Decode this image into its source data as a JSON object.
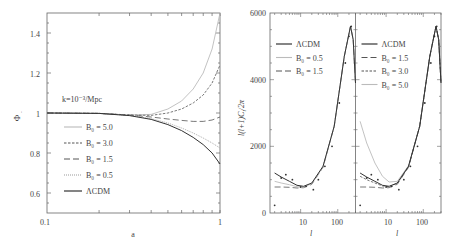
{
  "chart_data": [
    {
      "type": "line",
      "panel": "left",
      "title": "",
      "annotation": "k=10⁻³/Mpc",
      "xlabel": "a",
      "ylabel": "Φ₋",
      "xscale": "log",
      "xlim": [
        0.1,
        1
      ],
      "ylim": [
        0.5,
        1.5
      ],
      "xticks": [
        "0.1",
        "1"
      ],
      "yticks": [
        "0.6",
        "0.8",
        "1",
        "1.2",
        "1.4"
      ],
      "grid": false,
      "legend_position": "left-middle",
      "x": [
        0.1,
        0.2,
        0.3,
        0.4,
        0.5,
        0.6,
        0.7,
        0.8,
        0.9,
        1.0
      ],
      "series": [
        {
          "name": "B₀ = 5.0",
          "style": "dotted-light",
          "values": [
            1.0,
            0.998,
            0.99,
            0.993,
            1.02,
            1.06,
            1.12,
            1.2,
            1.32,
            1.5
          ]
        },
        {
          "name": "B₀ = 3.0",
          "style": "dashed-short",
          "values": [
            1.0,
            0.998,
            0.99,
            0.988,
            1.0,
            1.02,
            1.05,
            1.09,
            1.15,
            1.24
          ]
        },
        {
          "name": "B₀ = 1.5",
          "style": "dashed-long",
          "values": [
            1.0,
            0.998,
            0.99,
            0.98,
            0.97,
            0.963,
            0.958,
            0.958,
            0.965,
            0.98
          ]
        },
        {
          "name": "B₀ = 0.5",
          "style": "dotted-gray",
          "values": [
            1.0,
            0.998,
            0.988,
            0.972,
            0.95,
            0.925,
            0.9,
            0.875,
            0.85,
            0.825
          ]
        },
        {
          "name": "ΛCDM",
          "style": "solid",
          "values": [
            1.0,
            0.998,
            0.987,
            0.968,
            0.942,
            0.912,
            0.878,
            0.842,
            0.8,
            0.745
          ]
        }
      ]
    },
    {
      "type": "line",
      "panel": "right-a",
      "title": "",
      "xlabel": "l",
      "ylabel": "l(l+1)C_l/2π",
      "xscale": "log",
      "xlim": [
        1.5,
        300
      ],
      "ylim": [
        0,
        6000
      ],
      "xticks": [
        "10",
        "100"
      ],
      "yticks": [
        "0",
        "2000",
        "4000",
        "6000"
      ],
      "grid": false,
      "legend_position": "upper-left",
      "x": [
        2,
        3,
        5,
        8,
        12,
        20,
        40,
        80,
        150,
        220,
        260,
        300
      ],
      "series": [
        {
          "name": "ΛCDM",
          "style": "solid",
          "values": [
            1200,
            1080,
            950,
            830,
            800,
            900,
            1400,
            2600,
            4700,
            5600,
            5200,
            3900
          ]
        },
        {
          "name": "B₀ = 0.5",
          "style": "dotted-light",
          "values": [
            950,
            900,
            850,
            790,
            780,
            880,
            1380,
            2600,
            4700,
            5600,
            5200,
            3900
          ]
        },
        {
          "name": "B₀ = 1.5",
          "style": "dashed-long",
          "values": [
            780,
            780,
            770,
            750,
            760,
            860,
            1370,
            2600,
            4700,
            5600,
            5200,
            3900
          ]
        }
      ],
      "data_points": {
        "x": [
          2,
          3,
          4,
          6,
          10,
          14,
          22,
          30,
          45,
          70,
          110,
          160,
          200,
          230
        ],
        "y": [
          230,
          1050,
          1150,
          1000,
          780,
          800,
          700,
          1000,
          1400,
          2000,
          3300,
          4500,
          5300,
          5600
        ]
      }
    },
    {
      "type": "line",
      "panel": "right-b",
      "title": "",
      "xlabel": "l",
      "ylabel": "",
      "xscale": "log",
      "xlim": [
        1.5,
        300
      ],
      "ylim": [
        0,
        6000
      ],
      "xticks": [
        "10",
        "100"
      ],
      "grid": false,
      "legend_position": "upper-left",
      "x": [
        2,
        3,
        5,
        8,
        12,
        20,
        40,
        80,
        150,
        220,
        260,
        300
      ],
      "series": [
        {
          "name": "ΛCDM",
          "style": "solid",
          "values": [
            1200,
            1080,
            950,
            830,
            800,
            900,
            1400,
            2600,
            4700,
            5600,
            5200,
            3900
          ]
        },
        {
          "name": "B₀ = 1.5",
          "style": "dashed-long",
          "values": [
            780,
            780,
            770,
            750,
            760,
            860,
            1370,
            2600,
            4700,
            5600,
            5200,
            3900
          ]
        },
        {
          "name": "B₀ = 3.0",
          "style": "dashed-short",
          "values": [
            1100,
            1000,
            900,
            810,
            790,
            890,
            1390,
            2600,
            4700,
            5600,
            5200,
            3900
          ]
        },
        {
          "name": "B₀ = 5.0",
          "style": "dotted-light",
          "values": [
            2750,
            2100,
            1500,
            1100,
            930,
            950,
            1420,
            2600,
            4700,
            5600,
            5200,
            3900
          ]
        }
      ],
      "data_points": {
        "x": [
          2,
          3,
          4,
          6,
          10,
          14,
          22,
          30,
          45,
          70,
          110,
          160,
          200,
          230
        ],
        "y": [
          230,
          1050,
          1150,
          1000,
          780,
          800,
          700,
          1000,
          1400,
          2000,
          3300,
          4500,
          5300,
          5600
        ]
      }
    }
  ],
  "labels": {
    "left_annotation": "k=10⁻³/Mpc",
    "left_xlabel": "a",
    "left_ylabel": "Φ",
    "left_ylabel_sub": "-",
    "left_xtick_0": "0.1",
    "left_xtick_1": "1",
    "left_yticks": [
      "1.4",
      "1.2",
      "1",
      "0.8",
      "0.6"
    ],
    "left_legend": [
      "B₀ = 5.0",
      "B₀ = 3.0",
      "B₀ = 1.5",
      "B₀ = 0.5",
      "ΛCDM"
    ],
    "right_ylabel": "l(l+1)C",
    "right_ylabel_sub": "l",
    "right_ylabel_tail": "/2π",
    "right_yticks": [
      "6000",
      "4000",
      "2000",
      "0"
    ],
    "right_xticks": [
      "10",
      "100"
    ],
    "right_xlabel": "l",
    "right_a_legend": [
      "ΛCDM",
      "B₀ = 0.5",
      "B₀ = 1.5"
    ],
    "right_b_legend": [
      "ΛCDM",
      "B₀ = 1.5",
      "B₀ = 3.0",
      "B₀ = 5.0"
    ]
  }
}
